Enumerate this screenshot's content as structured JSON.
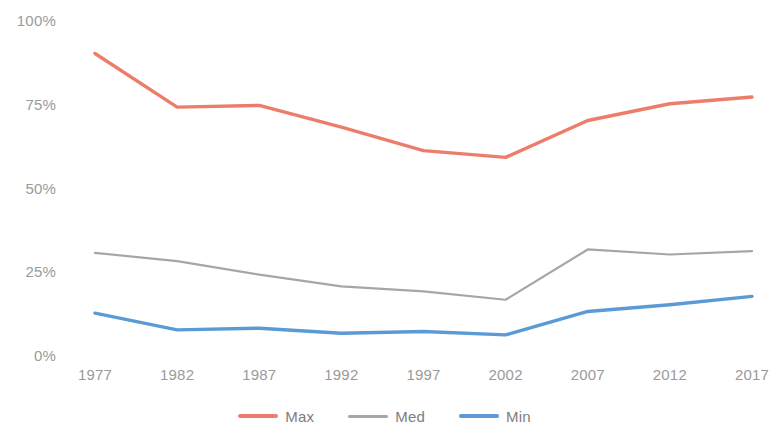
{
  "chart_data": {
    "type": "line",
    "title": "",
    "subtitle": "",
    "xlabel": "",
    "ylabel": "",
    "categories": [
      "1977",
      "1982",
      "1987",
      "1992",
      "1997",
      "2002",
      "2007",
      "2012",
      "2017"
    ],
    "x_tick_labels": [
      "1977",
      "1982",
      "1987",
      "1992",
      "1997",
      "2002",
      "2007",
      "2012",
      "2017"
    ],
    "y_tick_labels": [
      "0%",
      "25%",
      "50%",
      "75%",
      "100%"
    ],
    "y_tick_values": [
      0,
      25,
      50,
      75,
      100
    ],
    "ylim": [
      0,
      100
    ],
    "grid": false,
    "legend_position": "bottom",
    "series": [
      {
        "name": "Max",
        "color": "#ED7D6B",
        "values": [
          90,
          74,
          74.5,
          68,
          61,
          59,
          70,
          75,
          77
        ]
      },
      {
        "name": "Med",
        "color": "#A6A6A6",
        "values": [
          30.5,
          28,
          24,
          20.5,
          19,
          16.5,
          31.5,
          30,
          31
        ]
      },
      {
        "name": "Min",
        "color": "#5B9BD5",
        "values": [
          12.5,
          7.5,
          8,
          6.5,
          7,
          6,
          13,
          15,
          17.5
        ]
      }
    ]
  },
  "legend": {
    "items": [
      {
        "label": "Max",
        "color": "#ED7D6B"
      },
      {
        "label": "Med",
        "color": "#A6A6A6"
      },
      {
        "label": "Min",
        "color": "#5B9BD5"
      }
    ]
  },
  "axis": {
    "tick_color": "#9a9a9a"
  }
}
